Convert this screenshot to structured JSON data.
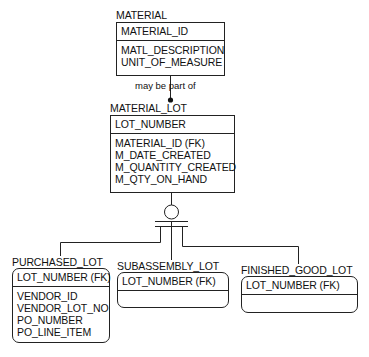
{
  "entities": {
    "material": {
      "name": "MATERIAL",
      "key": [
        "MATERIAL_ID"
      ],
      "attributes": [
        "MATL_DESCRIPTION",
        "UNIT_OF_MEASURE"
      ]
    },
    "material_lot": {
      "name": "MATERIAL_LOT",
      "key": [
        "LOT_NUMBER"
      ],
      "attributes": [
        "MATERIAL_ID (FK)",
        "M_DATE_CREATED",
        "M_QUANTITY_CREATED",
        "M_QTY_ON_HAND"
      ]
    },
    "purchased_lot": {
      "name": "PURCHASED_LOT",
      "key": [
        "LOT_NUMBER (FK)"
      ],
      "attributes": [
        "VENDOR_ID",
        "VENDOR_LOT_NO",
        "PO_NUMBER",
        "PO_LINE_ITEM"
      ]
    },
    "subassembly_lot": {
      "name": "SUBASSEMBLY_LOT",
      "key": [
        "LOT_NUMBER (FK)"
      ],
      "attributes": []
    },
    "finished_good_lot": {
      "name": "FINISHED_GOOD_LOT",
      "key": [
        "LOT_NUMBER (FK)"
      ],
      "attributes": []
    }
  },
  "relationships": [
    {
      "from": "MATERIAL",
      "to": "MATERIAL_LOT",
      "label": "may be part of",
      "cardinality": "one-to-zero-or-many"
    },
    {
      "type": "complete-subtype-category",
      "parent": "MATERIAL_LOT",
      "children": [
        "PURCHASED_LOT",
        "SUBASSEMBLY_LOT",
        "FINISHED_GOOD_LOT"
      ]
    }
  ]
}
